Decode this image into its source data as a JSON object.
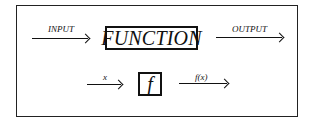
{
  "diagram": {
    "top_row": {
      "input_label": "INPUT",
      "box_label": "FUNCTION",
      "output_label": "OUTPUT"
    },
    "bottom_row": {
      "input_label": "x",
      "box_label": "f",
      "output_label": "f(x)"
    }
  }
}
